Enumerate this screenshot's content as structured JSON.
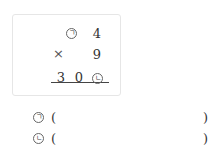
{
  "problem": {
    "row1": {
      "unknown": "ㄱ",
      "digit": "4"
    },
    "row2": {
      "operator": "×",
      "digit": "9"
    },
    "result": {
      "hundreds": "3",
      "tens": "0",
      "unknown": "ㄴ"
    }
  },
  "answers": [
    {
      "label": "ㄱ",
      "open": "(",
      "close": ")",
      "value": ""
    },
    {
      "label": "ㄴ",
      "open": "(",
      "close": ")",
      "value": ""
    }
  ]
}
